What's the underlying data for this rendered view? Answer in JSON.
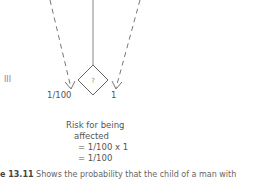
{
  "diagram": {
    "generation_label": "III",
    "node_symbol": "?",
    "left_probability": "1/100",
    "right_probability": "1",
    "risk": {
      "line1": "Risk for being",
      "line2": "affected",
      "line3": "= 1/100 x 1",
      "line4": "= 1/100"
    },
    "caption": {
      "figure_label": "e 13.11",
      "text": "Shows the probability that the child of a man with"
    }
  }
}
